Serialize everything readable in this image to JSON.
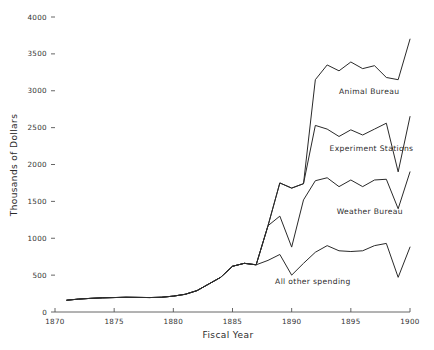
{
  "chart_data": {
    "type": "line",
    "title": "",
    "subtitle": "",
    "xlabel": "Fiscal Year",
    "ylabel": "Thousands of Dollars",
    "xlim": [
      1870,
      1900
    ],
    "ylim": [
      0,
      4000
    ],
    "grid": false,
    "legend_position": "inline-annotations",
    "x_ticks": [
      1870,
      1875,
      1880,
      1885,
      1890,
      1895,
      1900
    ],
    "x_tick_labels": [
      "1870",
      "1875",
      "1880",
      "1885",
      "1890",
      "1895",
      "1900"
    ],
    "y_ticks": [
      0,
      500,
      1000,
      1500,
      2000,
      2500,
      3000,
      3500,
      4000
    ],
    "y_tick_labels": [
      "0",
      "500",
      "1000",
      "1500",
      "2000",
      "2500",
      "3000",
      "3500",
      "4000"
    ],
    "x": [
      1871,
      1872,
      1873,
      1874,
      1875,
      1876,
      1877,
      1878,
      1879,
      1880,
      1881,
      1882,
      1883,
      1884,
      1885,
      1886,
      1887,
      1888,
      1889,
      1890,
      1891,
      1892,
      1893,
      1894,
      1895,
      1896,
      1897,
      1898,
      1899,
      1900
    ],
    "series": [
      {
        "name": "All other spending",
        "values": [
          160,
          175,
          185,
          192,
          196,
          200,
          198,
          196,
          200,
          215,
          240,
          290,
          380,
          470,
          620,
          660,
          640,
          700,
          780,
          500,
          660,
          810,
          900,
          830,
          820,
          830,
          900,
          930,
          470,
          880
        ]
      },
      {
        "name": "Weather Bureau",
        "values": [
          160,
          175,
          185,
          192,
          196,
          200,
          198,
          196,
          200,
          215,
          240,
          290,
          380,
          470,
          620,
          660,
          640,
          1170,
          1300,
          880,
          1520,
          1780,
          1820,
          1700,
          1790,
          1700,
          1790,
          1800,
          1400,
          1900
        ]
      },
      {
        "name": "Experiment Stations",
        "values": [
          160,
          175,
          185,
          192,
          196,
          200,
          198,
          196,
          200,
          215,
          240,
          290,
          380,
          470,
          620,
          660,
          640,
          1170,
          1750,
          1680,
          1740,
          2530,
          2480,
          2380,
          2470,
          2400,
          2480,
          2560,
          1900,
          2650
        ]
      },
      {
        "name": "Animal Bureau",
        "values": [
          160,
          175,
          185,
          192,
          196,
          200,
          198,
          196,
          200,
          215,
          240,
          290,
          380,
          470,
          620,
          660,
          640,
          1170,
          1750,
          1680,
          1740,
          3150,
          3350,
          3270,
          3390,
          3300,
          3340,
          3180,
          3150,
          3700
        ]
      }
    ],
    "annotations": [
      {
        "text": "Animal Bureau",
        "x": 1894.0,
        "y": 2950
      },
      {
        "text": "Experiment Stations",
        "x": 1893.2,
        "y": 2180
      },
      {
        "text": "Weather Bureau",
        "x": 1893.8,
        "y": 1330
      },
      {
        "text": "All other spending",
        "x": 1888.6,
        "y": 380
      }
    ]
  },
  "colors": {
    "line": "#2a2a2a",
    "axis": "#555555",
    "text": "#2b2b2b",
    "background": "#ffffff"
  }
}
